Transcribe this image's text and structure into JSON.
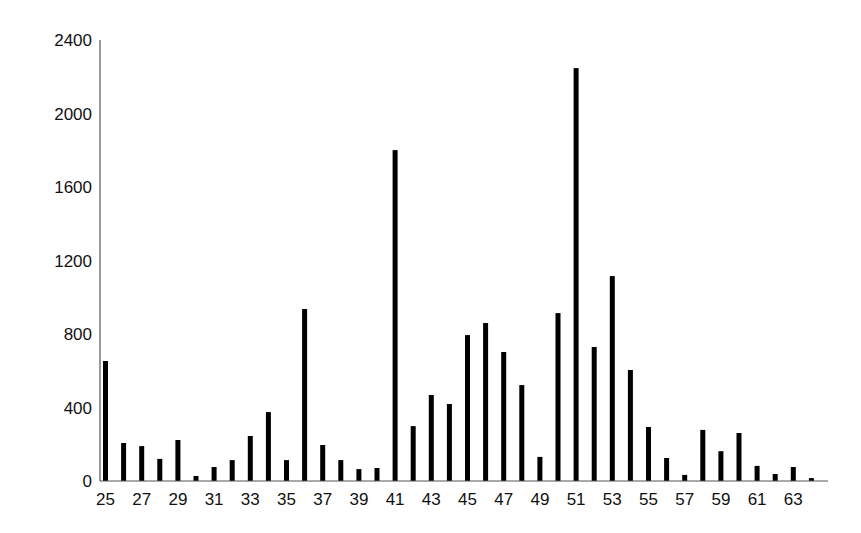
{
  "chart_data": {
    "type": "bar",
    "title": "",
    "xlabel": "",
    "ylabel": "",
    "ylim": [
      0,
      2400
    ],
    "yticks": [
      0,
      400,
      800,
      1200,
      1600,
      2000,
      2400
    ],
    "xtick_labels": [
      "25",
      "27",
      "29",
      "31",
      "33",
      "35",
      "37",
      "39",
      "41",
      "43",
      "45",
      "47",
      "49",
      "51",
      "53",
      "55",
      "57",
      "59",
      "61",
      "63"
    ],
    "grid": false,
    "legend": null,
    "categories": [
      25,
      26,
      27,
      28,
      29,
      30,
      31,
      32,
      33,
      34,
      35,
      36,
      37,
      38,
      39,
      40,
      41,
      42,
      43,
      44,
      45,
      46,
      47,
      48,
      49,
      50,
      51,
      52,
      53,
      54,
      55,
      56,
      57,
      58,
      59,
      60,
      61,
      62,
      63,
      64
    ],
    "values": [
      653,
      207,
      190,
      120,
      223,
      27,
      76,
      114,
      245,
      375,
      114,
      936,
      196,
      114,
      65,
      71,
      1801,
      299,
      468,
      419,
      794,
      860,
      702,
      522,
      131,
      914,
      2247,
      729,
      1115,
      604,
      294,
      125,
      33,
      278,
      162,
      261,
      82,
      38,
      76,
      16
    ],
    "bar_color": "#000000"
  }
}
